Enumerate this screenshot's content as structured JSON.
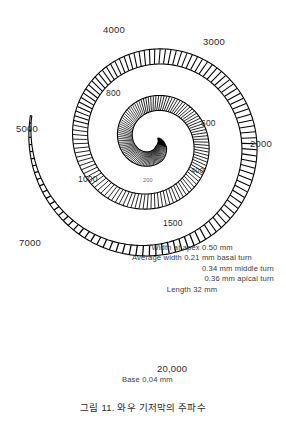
{
  "figure": {
    "caption": "그림 11. 와우 기저막의 주파수",
    "background_color": "#ffffff",
    "ink_color": "#000000"
  },
  "chart_data": {
    "type": "scatter",
    "title": "그림 11. 와우 기저막의 주파수",
    "subtitle": "Cochlear basilar membrane tonotopic frequency map",
    "xlabel": "",
    "ylabel": "",
    "grid": false,
    "legend_position": "none",
    "units": "Hz",
    "categories": [
      "200",
      "400",
      "600",
      "800",
      "1000",
      "1500",
      "2000",
      "3000",
      "4000",
      "5000",
      "7000",
      "20,000"
    ],
    "values": [
      200,
      400,
      600,
      800,
      1000,
      1500,
      2000,
      3000,
      4000,
      5000,
      7000,
      20000
    ],
    "points": [
      {
        "label": "200",
        "frequency_hz": 200,
        "x": 143,
        "y": 178,
        "size": "tiny"
      },
      {
        "label": "400",
        "frequency_hz": 400,
        "x": 191,
        "y": 167,
        "size": "inner"
      },
      {
        "label": "600",
        "frequency_hz": 600,
        "x": 201,
        "y": 119,
        "size": "mid"
      },
      {
        "label": "800",
        "frequency_hz": 800,
        "x": 106,
        "y": 89,
        "size": "mid"
      },
      {
        "label": "1000",
        "frequency_hz": 1000,
        "x": 78,
        "y": 175,
        "size": "mid"
      },
      {
        "label": "1500",
        "frequency_hz": 1500,
        "x": 163,
        "y": 219,
        "size": "mid"
      },
      {
        "label": "2000",
        "frequency_hz": 2000,
        "x": 250,
        "y": 139,
        "size": "outer"
      },
      {
        "label": "3000",
        "frequency_hz": 3000,
        "x": 203,
        "y": 37,
        "size": "outer"
      },
      {
        "label": "4000",
        "frequency_hz": 4000,
        "x": 103,
        "y": 25,
        "size": "outer"
      },
      {
        "label": "5000",
        "frequency_hz": 5000,
        "x": 16,
        "y": 124,
        "size": "outer"
      },
      {
        "label": "7000",
        "frequency_hz": 7000,
        "x": 19,
        "y": 238,
        "size": "outer"
      },
      {
        "label": "20,000",
        "frequency_hz": 20000,
        "x": 157,
        "y": 364,
        "size": "outer"
      }
    ],
    "annotations": [
      "Width at apex 0.50 mm",
      "Average width 0.21 mm basal turn",
      "0.34 mm middle turn",
      "0.36 mm apical turn",
      "Length 32 mm",
      "Base 0.04 mm"
    ]
  },
  "frequency_labels": [
    {
      "text": "4000",
      "x": 103,
      "y": 25,
      "size": "outer"
    },
    {
      "text": "3000",
      "x": 203,
      "y": 37,
      "size": "outer"
    },
    {
      "text": "2000",
      "x": 250,
      "y": 139,
      "size": "outer"
    },
    {
      "text": "5000",
      "x": 16,
      "y": 124,
      "size": "outer"
    },
    {
      "text": "7000",
      "x": 19,
      "y": 238,
      "size": "outer"
    },
    {
      "text": "800",
      "x": 106,
      "y": 89,
      "size": "mid"
    },
    {
      "text": "600",
      "x": 201,
      "y": 119,
      "size": "mid"
    },
    {
      "text": "400",
      "x": 191,
      "y": 167,
      "size": "inner"
    },
    {
      "text": "200",
      "x": 143,
      "y": 178,
      "size": "tiny"
    },
    {
      "text": "1000",
      "x": 78,
      "y": 175,
      "size": "mid"
    },
    {
      "text": "1500",
      "x": 163,
      "y": 219,
      "size": "mid"
    },
    {
      "text": "20,000",
      "x": 157,
      "y": 364,
      "size": "outer"
    }
  ],
  "measurements": {
    "line1": "Width at apex 0.50 mm",
    "line2": "Average width 0.21 mm basal turn",
    "line3": "0.34 mm middle turn",
    "line4": "0.36 mm apical turn",
    "line5": "Length 32 mm"
  },
  "base_annotation": "Base 0,04 mm"
}
